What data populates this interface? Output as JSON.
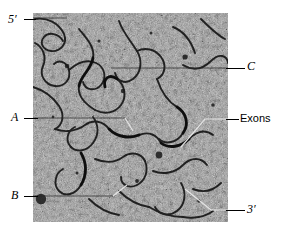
{
  "figure": {
    "type": "electron-micrograph",
    "micrograph": {
      "x": 33,
      "y": 13,
      "width": 195,
      "height": 209,
      "background_color": "#9a9a9a",
      "grain_color": "#2b2b2b",
      "strand_color": "#151515"
    },
    "labels": [
      {
        "id": "five-prime",
        "text": "5′",
        "style": "italic",
        "side": "left"
      },
      {
        "id": "loop-a",
        "text": "A",
        "style": "italic",
        "side": "left"
      },
      {
        "id": "loop-b",
        "text": "B",
        "style": "italic",
        "side": "left"
      },
      {
        "id": "loop-c",
        "text": "C",
        "style": "italic",
        "side": "right"
      },
      {
        "id": "exons",
        "text": "Exons",
        "style": "regular",
        "side": "right"
      },
      {
        "id": "three-prime",
        "text": "3′",
        "style": "italic",
        "side": "right"
      }
    ]
  },
  "labels": {
    "five_prime": "5′",
    "loop_a": "A",
    "loop_b": "B",
    "loop_c": "C",
    "exons": "Exons",
    "three_prime": "3′"
  },
  "colors": {
    "text": "#000000",
    "leader_line": "#000000",
    "white_leader_line": "#e8e8e8",
    "page_background": "#ffffff"
  }
}
